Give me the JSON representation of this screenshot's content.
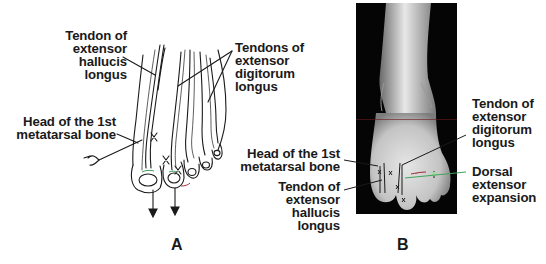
{
  "figure": {
    "panel_a": {
      "letter": "A",
      "labels": {
        "tendon_ehl": "Tendon of\nextensor\nhallucis\nlongus",
        "tendons_edl": "Tendons of\nextensor\ndigitorum\nlongus",
        "head_1st_metatarsal": "Head of the 1st\nmetatarsal bone"
      }
    },
    "panel_b": {
      "letter": "B",
      "labels": {
        "head_1st_metatarsal": "Head of the 1st\nmetatarsal bone",
        "tendon_ehl": "Tendon of\nextensor\nhallucis\nlongus",
        "tendon_edl": "Tendon of\nextensor\ndigitorum\nlongus",
        "dorsal_expansion": "Dorsal\nextensor\nexpansion"
      }
    },
    "colors": {
      "ink": "#1a1a1a",
      "photo_bg": "#050505",
      "skin_highlight": "#e6e6e6",
      "accent_green": "#3fa35a",
      "accent_red": "#b0303a"
    }
  }
}
